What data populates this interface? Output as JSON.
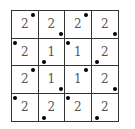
{
  "grid": {
    "rows": 4,
    "cols": 4,
    "cells": [
      {
        "value": "2",
        "dot": "TR"
      },
      {
        "value": "2",
        "dot": "BR"
      },
      {
        "value": "2",
        "dot": "TR"
      },
      {
        "value": "2",
        "dot": "BR"
      },
      {
        "value": "2",
        "dot": "TL"
      },
      {
        "value": "1",
        "dot": "BL"
      },
      {
        "value": "1",
        "dot": "TL"
      },
      {
        "value": "2",
        "dot": "BL"
      },
      {
        "value": "2",
        "dot": "TR"
      },
      {
        "value": "1",
        "dot": "BR"
      },
      {
        "value": "1",
        "dot": "TR"
      },
      {
        "value": "2",
        "dot": "BR"
      },
      {
        "value": "2",
        "dot": "TL"
      },
      {
        "value": "2",
        "dot": "BL"
      },
      {
        "value": "2",
        "dot": "TL"
      },
      {
        "value": "2",
        "dot": "BL"
      }
    ]
  }
}
